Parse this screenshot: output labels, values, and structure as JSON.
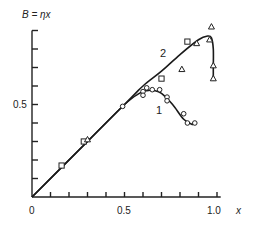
{
  "chart_data": {
    "type": "line",
    "title": "",
    "ylabel": "B = ηx",
    "xlabel": "x",
    "xlim": [
      0,
      1.0
    ],
    "ylim": [
      0,
      0.9
    ],
    "x_tick_labels": [
      "0",
      "0.5",
      "1.0"
    ],
    "y_tick_labels": [
      "0.5"
    ],
    "x_ticks": [
      0.1,
      0.2,
      0.3,
      0.4,
      0.5,
      0.6,
      0.7,
      0.8,
      0.9,
      1.0
    ],
    "y_ticks": [
      0.1,
      0.2,
      0.3,
      0.4,
      0.5,
      0.6,
      0.7,
      0.8,
      0.9
    ],
    "grid": false,
    "series": [
      {
        "name": "1",
        "curve": [
          [
            0,
            0
          ],
          [
            0.3,
            0.3
          ],
          [
            0.5,
            0.5
          ],
          [
            0.58,
            0.56
          ],
          [
            0.62,
            0.575
          ],
          [
            0.66,
            0.575
          ],
          [
            0.7,
            0.56
          ],
          [
            0.76,
            0.5
          ],
          [
            0.82,
            0.42
          ],
          [
            0.87,
            0.39
          ]
        ],
        "points_circle": [
          [
            0.49,
            0.49
          ],
          [
            0.6,
            0.57
          ],
          [
            0.62,
            0.59
          ],
          [
            0.65,
            0.58
          ],
          [
            0.6,
            0.55
          ],
          [
            0.69,
            0.58
          ],
          [
            0.73,
            0.54
          ],
          [
            0.73,
            0.52
          ],
          [
            0.82,
            0.45
          ],
          [
            0.84,
            0.4
          ],
          [
            0.88,
            0.4
          ]
        ]
      },
      {
        "name": "2",
        "curve": [
          [
            0,
            0
          ],
          [
            0.5,
            0.5
          ],
          [
            0.6,
            0.6
          ],
          [
            0.7,
            0.68
          ],
          [
            0.8,
            0.77
          ],
          [
            0.9,
            0.85
          ],
          [
            0.95,
            0.87
          ],
          [
            0.97,
            0.86
          ],
          [
            0.98,
            0.8
          ],
          [
            0.98,
            0.7
          ],
          [
            0.98,
            0.63
          ]
        ],
        "points_square": [
          [
            0.16,
            0.17
          ],
          [
            0.28,
            0.3
          ],
          [
            0.7,
            0.64
          ],
          [
            0.84,
            0.84
          ]
        ],
        "points_triangle": [
          [
            0.3,
            0.31
          ],
          [
            0.89,
            0.83
          ],
          [
            0.97,
            0.92
          ],
          [
            0.96,
            0.85
          ],
          [
            0.81,
            0.69
          ],
          [
            0.98,
            0.71
          ],
          [
            0.98,
            0.64
          ]
        ]
      }
    ],
    "annotations": [
      "1",
      "2"
    ]
  },
  "labels": {
    "y_axis": "B = ηx",
    "x_axis": "x",
    "origin": "0",
    "x_mid": "0.5",
    "x_end": "1.0",
    "y_mid": "0.5",
    "curve1": "1",
    "curve2": "2"
  }
}
